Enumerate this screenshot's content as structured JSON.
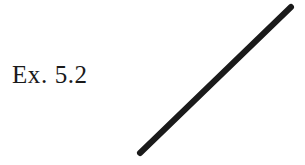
{
  "figure": {
    "background_color": "#ffffff",
    "label": {
      "text": "Ex. 5.2",
      "color": "#1a1a1a",
      "x": 12,
      "y": 61
    },
    "stroke_color": "#1a1a1a",
    "shapes": [
      {
        "name": "diagonal-line-segment",
        "type": "line",
        "x1": 140,
        "y1": 153,
        "x2": 291,
        "y2": 7,
        "stroke_width": 6,
        "stroke_color": "#1a1a1a"
      }
    ]
  }
}
